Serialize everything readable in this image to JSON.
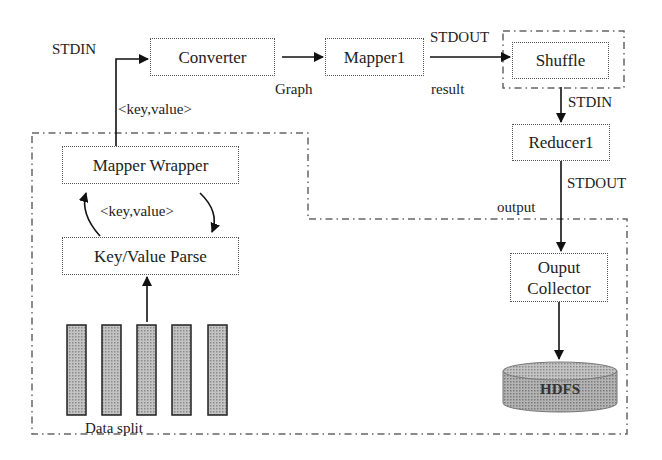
{
  "diagram": {
    "type": "flowchart",
    "nodes": {
      "converter": "Converter",
      "mapper1": "Mapper1",
      "shuffle": "Shuffle",
      "reducer1": "Reducer1",
      "output_collector_line1": "Ouput",
      "output_collector_line2": "Collector",
      "hdfs": "HDFS",
      "mapper_wrapper": "Mapper Wrapper",
      "key_value_parse": "Key/Value Parse",
      "data_split": "Data split"
    },
    "edge_labels": {
      "stdin_converter": "STDIN",
      "graph": "Graph",
      "stdout_mapper": "STDOUT",
      "result": "result",
      "stdin_reducer": "STDIN",
      "stdout_reducer": "STDOUT",
      "output": "output",
      "key_value_top": "<key,value>",
      "key_value_loop": "<key,value>"
    },
    "data_split_count": 5,
    "colors": {
      "line": "#111111",
      "box_border": "#555555",
      "bar_fill": "#b8b8b8",
      "hdfs_fill": "#a9a9a9"
    }
  }
}
